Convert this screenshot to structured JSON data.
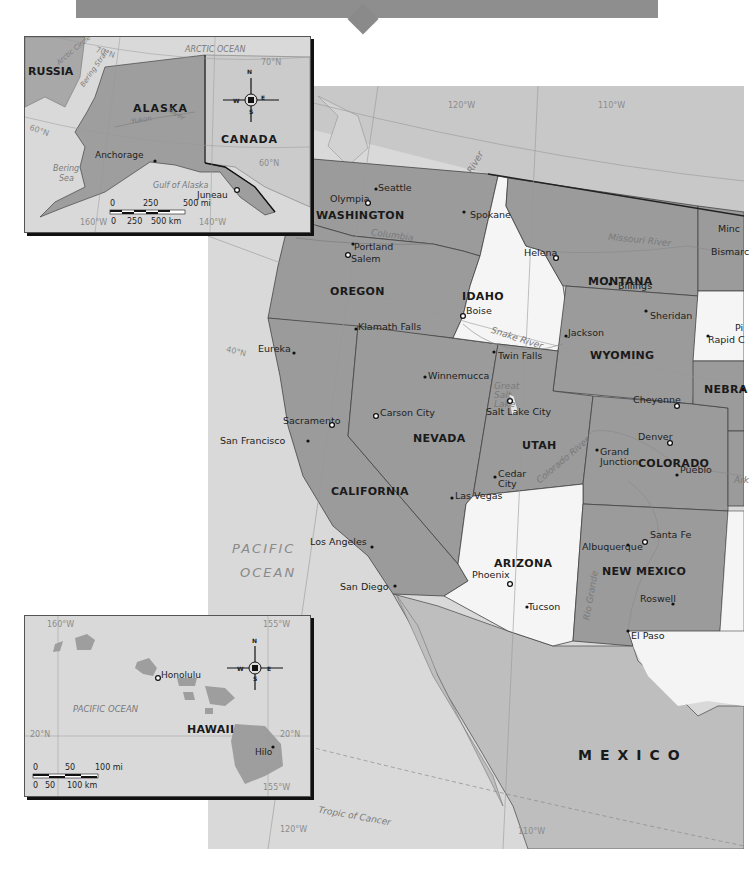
{
  "banner": {
    "color": "#8e8e8e"
  },
  "main_map": {
    "states": [
      {
        "name": "WASHINGTON"
      },
      {
        "name": "OREGON"
      },
      {
        "name": "IDAHO"
      },
      {
        "name": "MONTANA"
      },
      {
        "name": "WYOMING"
      },
      {
        "name": "NEVADA"
      },
      {
        "name": "UTAH"
      },
      {
        "name": "COLORADO"
      },
      {
        "name": "CALIFORNIA"
      },
      {
        "name": "ARIZONA"
      },
      {
        "name": "NEW MEXICO"
      },
      {
        "name": "NEBRA"
      }
    ],
    "cities": [
      {
        "name": "Seattle"
      },
      {
        "name": "Olympia"
      },
      {
        "name": "Spokane"
      },
      {
        "name": "Portland"
      },
      {
        "name": "Salem"
      },
      {
        "name": "Helena"
      },
      {
        "name": "Billings"
      },
      {
        "name": "Boise"
      },
      {
        "name": "Klamath Falls"
      },
      {
        "name": "Sheridan"
      },
      {
        "name": "Jackson"
      },
      {
        "name": "Twin Falls"
      },
      {
        "name": "Eureka"
      },
      {
        "name": "Winnemucca"
      },
      {
        "name": "Cheyenne"
      },
      {
        "name": "Salt Lake City"
      },
      {
        "name": "Sacramento"
      },
      {
        "name": "Carson City"
      },
      {
        "name": "San Francisco"
      },
      {
        "name": "Denver"
      },
      {
        "name": "Grand Junction"
      },
      {
        "name": "Pueblo"
      },
      {
        "name": "Cedar City"
      },
      {
        "name": "Las Vegas"
      },
      {
        "name": "Santa Fe"
      },
      {
        "name": "Albuquerque"
      },
      {
        "name": "Los Angeles"
      },
      {
        "name": "Phoenix"
      },
      {
        "name": "San Diego"
      },
      {
        "name": "Tucson"
      },
      {
        "name": "Roswell"
      },
      {
        "name": "El Paso"
      },
      {
        "name": "Minc"
      },
      {
        "name": "Bismarc"
      },
      {
        "name": "Pi"
      },
      {
        "name": "Rapid C"
      }
    ],
    "water_labels": {
      "columbia": "Columbia",
      "snake_river": "Snake River",
      "missouri_river": "Missouri River",
      "great_salt_lake": "Great Salt Lake",
      "colorado_river": "Colorado River",
      "rio_grande": "Rio Grande",
      "river": "River",
      "arkansas": "Ark",
      "pacific_ocean_1": "PACIFIC",
      "pacific_ocean_2": "OCEAN",
      "tropic_of_cancer": "Tropic of Cancer"
    },
    "countries": {
      "mexico": "MEXICO"
    },
    "gridlines": {
      "lon_120_top": "120°W",
      "lon_110_top": "110°W",
      "lat_50": "50°N",
      "lat_40": "40°N",
      "lon_120_bottom": "120°W",
      "lon_110_bottom": "110°W"
    }
  },
  "alaska_inset": {
    "labels": {
      "russia": "RUSSIA",
      "alaska": "ALASKA",
      "canada": "CANADA",
      "arctic_ocean": "ARCTIC OCEAN",
      "bering_strait": "Bering Strait",
      "bering_sea_1": "Bering",
      "bering_sea_2": "Sea",
      "gulf_of_alaska": "Gulf of Alaska",
      "yukon": "Yukon",
      "river": "River",
      "anchorage": "Anchorage",
      "juneau": "Juneau",
      "arctic_circle": "Arctic Circle"
    },
    "grid": {
      "lat_70_a": "70°N",
      "lat_70_b": "70°N",
      "lat_60_a": "60°N",
      "lat_60_b": "60°N",
      "lon_160": "160°W",
      "lon_140": "140°W"
    },
    "scale": {
      "mi_0": "0",
      "mi_250": "250",
      "mi_500": "500 mi",
      "km_0": "0",
      "km_250": "250",
      "km_500": "500 km"
    },
    "compass": {
      "n": "N",
      "s": "S",
      "e": "E",
      "w": "W"
    }
  },
  "hawaii_inset": {
    "labels": {
      "honolulu": "Honolulu",
      "hilo": "Hilo",
      "hawaii": "HAWAII",
      "pacific_ocean": "PACIFIC OCEAN"
    },
    "grid": {
      "lon_160": "160°W",
      "lon_155_top": "155°W",
      "lon_155_bottom": "155°W",
      "lat_20_left": "20°N",
      "lat_20_right": "20°N"
    },
    "scale": {
      "mi_0": "0",
      "mi_50": "50",
      "mi_100": "100 mi",
      "km_0": "0",
      "km_50": "50",
      "km_100": "100 km"
    },
    "compass": {
      "n": "N",
      "s": "S",
      "e": "E",
      "w": "W"
    }
  },
  "colors": {
    "ocean": "#d8d8d8",
    "state_dark": "#9a9a9a",
    "state_white": "#f6f6f6",
    "canada": "#c9c9c9",
    "mexico": "#bdbdbd",
    "border": "#333333"
  }
}
